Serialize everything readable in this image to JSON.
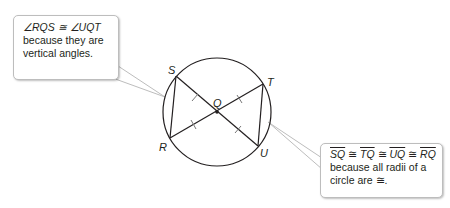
{
  "diagram": {
    "circle": {
      "cx": 217,
      "cy": 112,
      "r": 54,
      "stroke": "#231f20"
    },
    "points": {
      "S": {
        "x": 176,
        "y": 76,
        "label": "S"
      },
      "T": {
        "x": 263,
        "y": 84,
        "label": "T"
      },
      "R": {
        "x": 170,
        "y": 138,
        "label": "R"
      },
      "U": {
        "x": 258,
        "y": 146,
        "label": "U"
      },
      "Q": {
        "x": 217,
        "y": 112,
        "label": "Q"
      }
    },
    "segments": [
      "SU",
      "TR",
      "SR",
      "TU"
    ],
    "tick_marks": [
      "SQ",
      "TQ",
      "UQ",
      "RQ"
    ]
  },
  "callouts": {
    "left": {
      "line1": "∠RQS ≅ ∠UQT",
      "line2": "because they are",
      "line3": "vertical angles."
    },
    "right": {
      "seg1": "SQ",
      "seg2": "TQ",
      "seg3": "UQ",
      "seg4": "RQ",
      "congruent": "≅",
      "line2": "because all radii of a",
      "line3": "circle are ≅."
    }
  }
}
